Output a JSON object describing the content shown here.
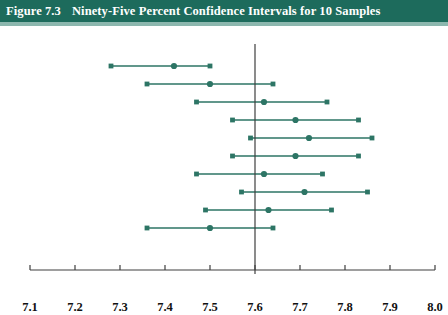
{
  "figure": {
    "number_label": "Figure 7.3",
    "title": "Ninety-Five Percent Confidence Intervals for 10 Samples",
    "header_bg": "#1d6b5c",
    "header_text_color": "#ffffff"
  },
  "chart_data": {
    "type": "line",
    "title": "Ninety-Five Percent Confidence Intervals for 10 Samples",
    "subtitle": "",
    "xlabel": "μ",
    "xlabel_subscript": "Y",
    "ylabel": "",
    "xlim": [
      7.1,
      8.0
    ],
    "xticks": [
      7.1,
      7.2,
      7.3,
      7.4,
      7.5,
      7.6,
      7.7,
      7.8,
      7.9,
      8.0
    ],
    "xtick_labels": [
      "7.1",
      "7.2",
      "7.3",
      "7.4",
      "7.5",
      "7.6",
      "7.7",
      "7.8",
      "7.9",
      "8.0"
    ],
    "grid": false,
    "legend": false,
    "series_color": "#2d7565",
    "reference_line": {
      "value": 7.6,
      "label": "",
      "color": "#3f3f3f",
      "orientation": "vertical"
    },
    "intervals": [
      {
        "sample": 1,
        "lower": 7.28,
        "estimate": 7.42,
        "upper": 7.5,
        "contains_mu": false
      },
      {
        "sample": 2,
        "lower": 7.36,
        "estimate": 7.5,
        "upper": 7.64,
        "contains_mu": true
      },
      {
        "sample": 3,
        "lower": 7.47,
        "estimate": 7.62,
        "upper": 7.76,
        "contains_mu": true
      },
      {
        "sample": 4,
        "lower": 7.55,
        "estimate": 7.69,
        "upper": 7.83,
        "contains_mu": true
      },
      {
        "sample": 5,
        "lower": 7.59,
        "estimate": 7.72,
        "upper": 7.86,
        "contains_mu": true
      },
      {
        "sample": 6,
        "lower": 7.55,
        "estimate": 7.69,
        "upper": 7.83,
        "contains_mu": true
      },
      {
        "sample": 7,
        "lower": 7.47,
        "estimate": 7.62,
        "upper": 7.75,
        "contains_mu": true
      },
      {
        "sample": 8,
        "lower": 7.57,
        "estimate": 7.71,
        "upper": 7.85,
        "contains_mu": true
      },
      {
        "sample": 9,
        "lower": 7.49,
        "estimate": 7.63,
        "upper": 7.77,
        "contains_mu": true
      },
      {
        "sample": 10,
        "lower": 7.36,
        "estimate": 7.5,
        "upper": 7.64,
        "contains_mu": true
      }
    ]
  },
  "layout": {
    "plot_left_px": 30,
    "plot_right_px": 435,
    "axis_y_px": 244,
    "row_start_y_px": 40,
    "row_spacing_px": 18,
    "reference_line_top_px": 18,
    "reference_line_bottom_px": 248
  }
}
